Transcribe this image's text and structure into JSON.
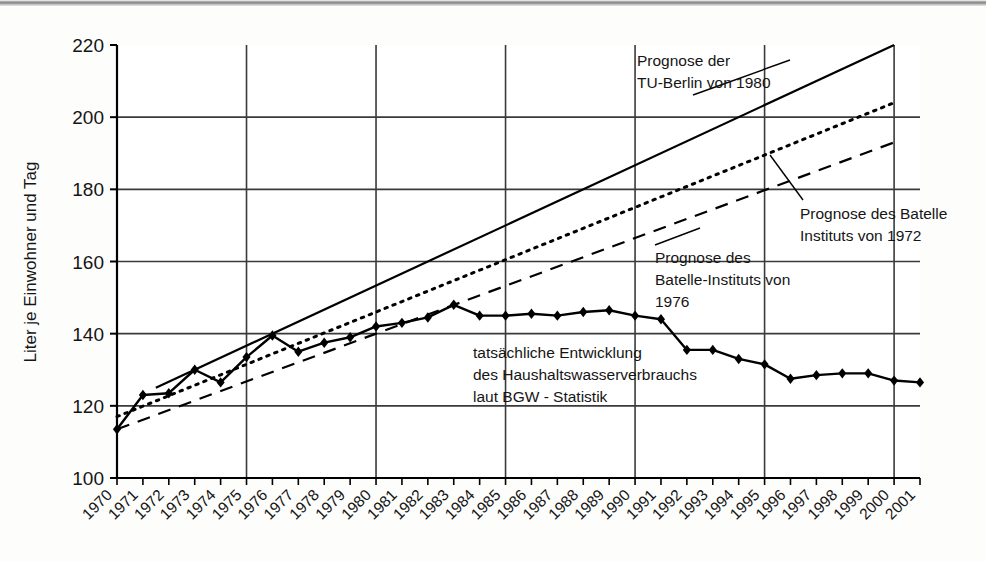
{
  "chart_data": {
    "type": "line",
    "title": "",
    "xlabel": "",
    "ylabel": "Liter je Einwohner und Tag",
    "xlim": [
      1970,
      2001
    ],
    "ylim": [
      100,
      220
    ],
    "yticks": [
      100,
      120,
      140,
      160,
      180,
      200,
      220
    ],
    "xticks": [
      1970,
      1971,
      1972,
      1973,
      1974,
      1975,
      1976,
      1977,
      1978,
      1979,
      1980,
      1981,
      1982,
      1983,
      1984,
      1985,
      1986,
      1987,
      1988,
      1989,
      1990,
      1991,
      1992,
      1993,
      1994,
      1995,
      1996,
      1997,
      1998,
      1999,
      2000,
      2001
    ],
    "gridlines": {
      "horizontal": [
        120,
        140,
        160,
        180,
        200
      ],
      "vertical": [
        1975,
        1980,
        1985,
        1990,
        1995,
        2000
      ],
      "grid": "on"
    },
    "legend_position": "none",
    "x": [
      1970,
      1971,
      1972,
      1973,
      1974,
      1975,
      1976,
      1977,
      1978,
      1979,
      1980,
      1981,
      1982,
      1983,
      1984,
      1985,
      1986,
      1987,
      1988,
      1989,
      1990,
      1991,
      1992,
      1993,
      1994,
      1995,
      1996,
      1997,
      1998,
      1999,
      2000,
      2001
    ],
    "series": [
      {
        "name": "tatsächliche Entwicklung des Haushaltswasserverbrauchs laut BGW - Statistik",
        "style": "solid-with-diamond-markers",
        "values": [
          113.5,
          123,
          123.5,
          130,
          126.5,
          133.5,
          139.5,
          135,
          137.5,
          139,
          142,
          143,
          144.5,
          148,
          145,
          145,
          145.5,
          145,
          146,
          146.5,
          145,
          144,
          135.5,
          135.5,
          133,
          131.5,
          127.5,
          128.5,
          129,
          129,
          127,
          126.5
        ]
      },
      {
        "name": "Prognose der TU-Berlin von 1980",
        "style": "solid-straight",
        "x": [
          1971.5,
          2000
        ],
        "values": [
          125,
          220
        ]
      },
      {
        "name": "Prognose des Batelle-Instituts von 1976",
        "style": "dotted-straight",
        "x": [
          1970,
          2000
        ],
        "values": [
          117,
          204
        ]
      },
      {
        "name": "Prognose des Batelle Instituts von 1972",
        "style": "dashed-straight",
        "x": [
          1970,
          2000
        ],
        "values": [
          113.5,
          193
        ]
      }
    ],
    "annotations": [
      {
        "id": "annotation-tu-berlin",
        "lines": [
          "Prognose der",
          "TU-Berlin von 1980"
        ],
        "text": "Prognose der TU-Berlin von 1980"
      },
      {
        "id": "annotation-batelle-1972",
        "lines": [
          "Prognose des Batelle",
          "Instituts von 1972"
        ],
        "text": "Prognose des Batelle Instituts von 1972"
      },
      {
        "id": "annotation-batelle-1976",
        "lines": [
          "Prognose des",
          "Batelle-Instituts von",
          "1976"
        ],
        "text": "Prognose des Batelle-Instituts von 1976"
      },
      {
        "id": "annotation-actual",
        "lines": [
          "tatsächliche Entwicklung",
          "des Haushaltswasserverbrauchs",
          "laut BGW - Statistik"
        ],
        "text": "tatsächliche Entwicklung des Haushaltswasserverbrauchs laut BGW - Statistik"
      }
    ],
    "colors": {
      "line": "#000000",
      "grid": "#3a3a3a",
      "axis": "#000000",
      "background": "#fdfdfc",
      "text": "#151515"
    }
  }
}
